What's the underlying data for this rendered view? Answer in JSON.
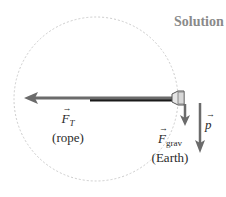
{
  "header": {
    "title": "Solution"
  },
  "diagram": {
    "colors": {
      "circle": "#cccccc",
      "arrow": "#6b6b6b",
      "rope": "#1a1a1a",
      "text": "#2a2a2a",
      "title": "#8a8a8a"
    },
    "circle": {
      "cx": 96,
      "cy": 99,
      "r": 82,
      "style": "dashed"
    },
    "forces": [
      {
        "id": "tension",
        "symbol": "F",
        "subscript": "T",
        "source": "(rope)",
        "direction": "left"
      },
      {
        "id": "gravity",
        "symbol": "F",
        "subscript": "grav",
        "source": "(Earth)",
        "direction": "down"
      },
      {
        "id": "momentum",
        "symbol": "p",
        "subscript": "",
        "source": "",
        "direction": "down"
      }
    ]
  }
}
